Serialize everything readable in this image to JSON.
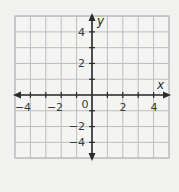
{
  "diagram": {
    "type": "coordinate-grid",
    "x_axis": {
      "label": "x",
      "min": -5,
      "max": 5,
      "tick_labels": [
        "−4",
        "−2",
        "0",
        "2",
        "4"
      ],
      "tick_values": [
        -4,
        -2,
        0,
        2,
        4
      ]
    },
    "y_axis": {
      "label": "y",
      "min": -4,
      "max": 5,
      "tick_labels": [
        "4",
        "2",
        "−2",
        "−4"
      ],
      "tick_values": [
        4,
        2,
        -2,
        -4
      ]
    },
    "grid": {
      "step": 1,
      "color": "#bdbdbd"
    },
    "axis_color": "#2b2b2b",
    "background": "#f1f1f0",
    "grid_background": "#f4f4f3"
  }
}
